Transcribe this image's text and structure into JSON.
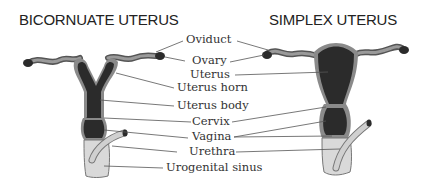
{
  "titles": {
    "left": "BICORNUATE UTERUS",
    "right": "SIMPLEX UTERUS"
  },
  "labels": [
    {
      "key": "oviduct",
      "text": "Oviduct"
    },
    {
      "key": "ovary",
      "text": "Ovary"
    },
    {
      "key": "uterus",
      "text": "Uterus"
    },
    {
      "key": "uterus_horn",
      "text": "Uterus horn"
    },
    {
      "key": "uterus_body",
      "text": "Uterus body"
    },
    {
      "key": "cervix",
      "text": "Cervix"
    },
    {
      "key": "vagina",
      "text": "Vagina"
    },
    {
      "key": "urethra",
      "text": "Urethra"
    },
    {
      "key": "urogenital_sinus",
      "text": "Urogenital sinus"
    }
  ],
  "colors": {
    "dark_tissue": "#2b2b2b",
    "mid_gray": "#8a8a8a",
    "light_gray": "#cfcfcf",
    "sinus_fill": "#d9d9d9",
    "leader_line": "#555555"
  }
}
